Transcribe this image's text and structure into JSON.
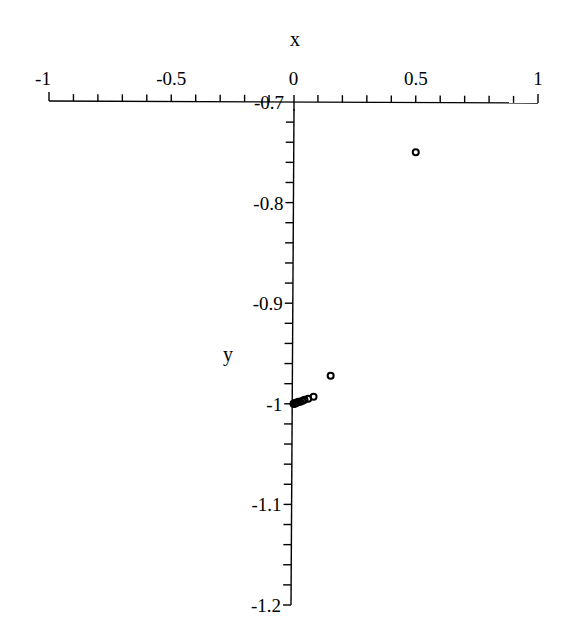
{
  "chart_data": {
    "type": "scatter",
    "title": "",
    "xlabel": "x",
    "ylabel": "y",
    "xlim": [
      -1,
      1
    ],
    "ylim": [
      -1.2,
      -0.7
    ],
    "x_ticks": [
      "-1",
      "-0.5",
      "0",
      "0.5",
      "1"
    ],
    "y_ticks": [
      "-0.7",
      "-0.8",
      "-0.9",
      "-1",
      "-1.1",
      "-1.2"
    ],
    "grid": false,
    "legend": null,
    "marker": "open-circle",
    "color": "#000000",
    "series": [
      {
        "name": "points",
        "x": [
          0.5,
          0.152,
          0.082,
          0.06,
          0.045,
          0.037,
          0.028,
          0.02,
          0.014,
          0.009,
          0.005,
          0.002,
          0.0
        ],
        "y": [
          -0.75,
          -0.972,
          -0.993,
          -0.995,
          -0.996,
          -0.997,
          -0.998,
          -0.998,
          -0.999,
          -0.999,
          -1.0,
          -1.0,
          -1.0
        ]
      }
    ]
  }
}
